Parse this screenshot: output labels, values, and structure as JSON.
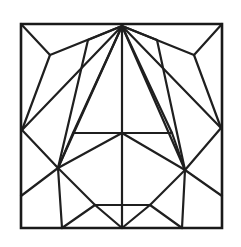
{
  "figure": {
    "canvas_width": 241,
    "canvas_height": 247,
    "background_color": "#ffffff",
    "line_color": "#1f1f1f",
    "frame_color": "#1a1a1a",
    "line_width": 2.2,
    "frame_width": 2.6,
    "symmetry": "bilateral-vertical",
    "axis_x": 122
  },
  "chart_data": {
    "type": "diagram",
    "xlabel": "",
    "ylabel": "",
    "xlim": [
      0,
      241
    ],
    "ylim": [
      0,
      247
    ],
    "grid": false,
    "legend": "none",
    "frame": {
      "name": "outer-square",
      "x": 21,
      "y": 24,
      "width": 201,
      "height": 204,
      "points": "21,24 222,24 222,228 21,228 21,24"
    },
    "vertices": {
      "corner_tl": [
        21,
        24
      ],
      "corner_tr": [
        222,
        24
      ],
      "corner_bl": [
        21,
        228
      ],
      "corner_br": [
        222,
        228
      ],
      "apex_top": [
        122,
        26
      ],
      "top_left_node": [
        88,
        40
      ],
      "top_right_node": [
        157,
        40
      ],
      "left_y_node": [
        50,
        55
      ],
      "right_y_node": [
        194,
        55
      ],
      "left_edge_node": [
        22,
        130
      ],
      "right_edge_node": [
        221,
        128
      ],
      "hub_center": [
        122,
        133
      ],
      "bar_left": [
        73,
        133
      ],
      "bar_right": [
        172,
        133
      ],
      "hex_left": [
        58,
        168
      ],
      "hex_right": [
        185,
        170
      ],
      "hex_bottom_left": [
        95,
        205
      ],
      "hex_bottom_right": [
        150,
        205
      ],
      "bottom_center": [
        122,
        228
      ],
      "bottom_left_foot": [
        62,
        228
      ],
      "bottom_right_foot": [
        182,
        228
      ],
      "left_mid_edge": [
        21,
        196
      ],
      "right_mid_edge": [
        222,
        196
      ]
    },
    "segments": [
      {
        "name": "fan-apex-to-left-edge-node",
        "from": [
          122,
          26
        ],
        "to": [
          22,
          130
        ]
      },
      {
        "name": "fan-apex-to-left-y-node",
        "from": [
          122,
          26
        ],
        "to": [
          50,
          55
        ]
      },
      {
        "name": "fan-apex-to-top-left-node",
        "from": [
          122,
          26
        ],
        "to": [
          88,
          40
        ]
      },
      {
        "name": "fan-apex-to-bar-left",
        "from": [
          122,
          26
        ],
        "to": [
          73,
          133
        ]
      },
      {
        "name": "fan-apex-to-hex-left",
        "from": [
          122,
          26
        ],
        "to": [
          58,
          168
        ]
      },
      {
        "name": "fan-apex-to-hub",
        "from": [
          122,
          26
        ],
        "to": [
          122,
          133
        ]
      },
      {
        "name": "fan-apex-to-hex-right",
        "from": [
          122,
          26
        ],
        "to": [
          185,
          170
        ]
      },
      {
        "name": "fan-apex-to-bar-right",
        "from": [
          122,
          26
        ],
        "to": [
          172,
          133
        ]
      },
      {
        "name": "fan-apex-to-top-right-node",
        "from": [
          122,
          26
        ],
        "to": [
          157,
          40
        ]
      },
      {
        "name": "fan-apex-to-right-y-node",
        "from": [
          122,
          26
        ],
        "to": [
          194,
          55
        ]
      },
      {
        "name": "fan-apex-to-right-edge-node",
        "from": [
          122,
          26
        ],
        "to": [
          221,
          128
        ]
      },
      {
        "name": "corner-tl-to-left-y-node",
        "from": [
          21,
          24
        ],
        "to": [
          50,
          55
        ]
      },
      {
        "name": "left-y-node-to-left-edge-node",
        "from": [
          50,
          55
        ],
        "to": [
          22,
          130
        ]
      },
      {
        "name": "top-left-node-to-hex-left",
        "from": [
          88,
          40
        ],
        "to": [
          58,
          168
        ]
      },
      {
        "name": "corner-tr-to-right-y-node",
        "from": [
          222,
          24
        ],
        "to": [
          194,
          55
        ]
      },
      {
        "name": "right-y-node-to-right-edge-node",
        "from": [
          194,
          55
        ],
        "to": [
          221,
          128
        ]
      },
      {
        "name": "top-right-node-to-hex-right",
        "from": [
          157,
          40
        ],
        "to": [
          185,
          170
        ]
      },
      {
        "name": "horizontal-bar",
        "from": [
          73,
          133
        ],
        "to": [
          172,
          133
        ]
      },
      {
        "name": "hub-to-hex-left",
        "from": [
          122,
          133
        ],
        "to": [
          58,
          168
        ]
      },
      {
        "name": "hub-to-hex-right",
        "from": [
          122,
          133
        ],
        "to": [
          185,
          170
        ]
      },
      {
        "name": "hub-to-bottom-center",
        "from": [
          122,
          133
        ],
        "to": [
          122,
          228
        ]
      },
      {
        "name": "hex-left-to-hex-bottom-left",
        "from": [
          58,
          168
        ],
        "to": [
          95,
          205
        ]
      },
      {
        "name": "hex-bottom-left-to-hex-bottom-right",
        "from": [
          95,
          205
        ],
        "to": [
          150,
          205
        ]
      },
      {
        "name": "hex-bottom-right-to-hex-right",
        "from": [
          150,
          205
        ],
        "to": [
          185,
          170
        ]
      },
      {
        "name": "hex-left-to-left-edge-node",
        "from": [
          58,
          168
        ],
        "to": [
          22,
          130
        ]
      },
      {
        "name": "hex-right-to-right-edge-node",
        "from": [
          185,
          170
        ],
        "to": [
          221,
          128
        ]
      },
      {
        "name": "hex-left-to-bottom-left-foot",
        "from": [
          58,
          168
        ],
        "to": [
          62,
          228
        ]
      },
      {
        "name": "hex-right-to-bottom-right-foot",
        "from": [
          185,
          170
        ],
        "to": [
          182,
          228
        ]
      },
      {
        "name": "bar-left-to-hex-left",
        "from": [
          73,
          133
        ],
        "to": [
          58,
          168
        ]
      },
      {
        "name": "bar-right-to-hex-right",
        "from": [
          172,
          133
        ],
        "to": [
          185,
          170
        ]
      },
      {
        "name": "left-mid-edge-to-hex-left",
        "from": [
          21,
          196
        ],
        "to": [
          58,
          168
        ]
      },
      {
        "name": "right-mid-edge-to-hex-right",
        "from": [
          222,
          196
        ],
        "to": [
          185,
          170
        ]
      },
      {
        "name": "hex-bottom-left-to-bottom-center",
        "from": [
          95,
          205
        ],
        "to": [
          122,
          228
        ]
      },
      {
        "name": "hex-bottom-right-to-bottom-center",
        "from": [
          150,
          205
        ],
        "to": [
          122,
          228
        ]
      },
      {
        "name": "bottom-left-foot-to-hex-bottom-left",
        "from": [
          62,
          228
        ],
        "to": [
          95,
          205
        ]
      },
      {
        "name": "bottom-right-foot-to-hex-bottom-right",
        "from": [
          182,
          228
        ],
        "to": [
          150,
          205
        ]
      }
    ]
  }
}
